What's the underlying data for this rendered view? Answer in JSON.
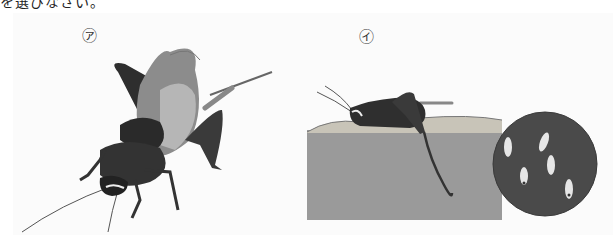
{
  "header": {
    "clipped_text": "を選びなさい。"
  },
  "figures": [
    {
      "label": "㋐",
      "description": "Cricket (adult) viewed from above, with wings, long antennae and ovipositor"
    },
    {
      "label": "㋑",
      "description": "Female cricket laying eggs into the soil with ovipositor; cross-section of ground"
    }
  ],
  "inset": {
    "description": "Magnified circular view of eggs in soil",
    "egg_count": 6
  },
  "colors": {
    "background": "#ffffff",
    "panel": "#fbfbfb",
    "ground": "#9a9a9a",
    "topsoil": "#c8c4b8",
    "insect_dark": "#2f2f2f",
    "wing": "#8a8a8a",
    "inset_soil": "#4a4a4a",
    "egg": "#e6e6e6"
  }
}
